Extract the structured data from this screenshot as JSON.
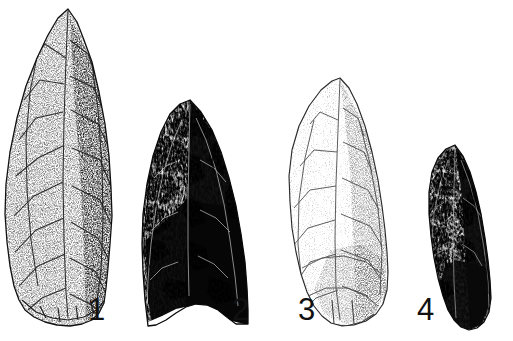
{
  "figure": {
    "kind": "archaeological-plate",
    "background_color": "#ffffff",
    "ink_color": "#111111",
    "width_px": 513,
    "height_px": 341,
    "label_font_size_px": 31
  },
  "artifacts": [
    {
      "label": "1",
      "name": "projectile-point-1",
      "shape": "long narrow lanceolate biface",
      "tone": "light stippled (pale chert)",
      "base": "slightly convex / rounded",
      "bounds": {
        "x": 5,
        "y": 8,
        "width": 108,
        "height": 318
      },
      "tip": {
        "x": 68,
        "y": 9
      },
      "label_pos": {
        "x": 88,
        "y": 294
      }
    },
    {
      "label": "2",
      "name": "projectile-point-2",
      "shape": "broad triangular-lanceolate biface",
      "tone": "very dark high-contrast (obsidian / dark chert)",
      "base": "deeply concave (fishtail)",
      "bounds": {
        "x": 139,
        "y": 99,
        "width": 110,
        "height": 228
      },
      "tip": {
        "x": 190,
        "y": 100
      },
      "label_pos": {
        "x": 232,
        "y": 294
      }
    },
    {
      "label": "3",
      "name": "projectile-point-3",
      "shape": "leaf-shaped / ovate biface",
      "tone": "very light stippled (white / pale chert)",
      "base": "narrow rounded",
      "bounds": {
        "x": 286,
        "y": 77,
        "width": 104,
        "height": 250
      },
      "tip": {
        "x": 340,
        "y": 78
      },
      "label_pos": {
        "x": 298,
        "y": 294
      }
    },
    {
      "label": "4",
      "name": "projectile-point-4",
      "shape": "small narrow lanceolate biface",
      "tone": "dark mottled with light highlights",
      "base": "pointed / tapered",
      "bounds": {
        "x": 428,
        "y": 144,
        "width": 66,
        "height": 186
      },
      "tip": {
        "x": 455,
        "y": 145
      },
      "label_pos": {
        "x": 417,
        "y": 294
      }
    }
  ]
}
